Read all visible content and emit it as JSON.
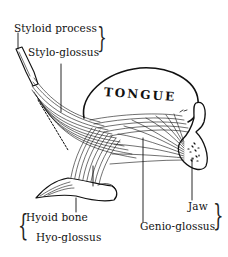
{
  "diagram": {
    "type": "anatomical illustration",
    "organ_label": "TONGUE",
    "labels": {
      "styloid_process": "Styloid process",
      "stylo_glossus": "Stylo-glossus",
      "hyoid_bone": "Hyoid bone",
      "hyo_glossus": "Hyo-glossus",
      "jaw": "Jaw",
      "genio_glossus": "Genio-glossus"
    },
    "colors": {
      "ink": "#111111",
      "background": "#ffffff"
    }
  }
}
